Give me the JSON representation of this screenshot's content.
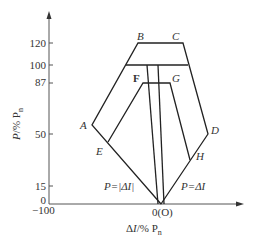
{
  "axes": {
    "y_label": "P/% Pn",
    "y_label_main": "P/% P",
    "y_label_sub": "n",
    "x_label_main": "ΔI/% P",
    "x_label_sub": "n",
    "y_ticks": [
      {
        "label": "120",
        "value": 120
      },
      {
        "label": "100",
        "value": 100
      },
      {
        "label": "87",
        "value": 87
      },
      {
        "label": "50",
        "value": 50
      },
      {
        "label": "15",
        "value": 15
      },
      {
        "label": "0",
        "value": 0
      }
    ],
    "x_ticks": [
      {
        "label": "−100",
        "value": -100
      },
      {
        "label": "0(O)",
        "value": 0
      }
    ]
  },
  "points": {
    "A": "A",
    "B": "B",
    "C": "C",
    "D": "D",
    "E": "E",
    "F": "F",
    "G": "G",
    "H": "H"
  },
  "equations": {
    "left": "P=|ΔI|",
    "right": "P=ΔI"
  },
  "colors": {
    "line": "#222222",
    "axis": "#555555",
    "text": "#333333"
  }
}
